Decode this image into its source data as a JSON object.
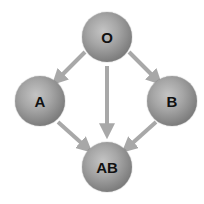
{
  "diagram": {
    "nodes": [
      {
        "id": "O",
        "label": "O",
        "cx": 107,
        "cy": 37
      },
      {
        "id": "A",
        "label": "A",
        "cx": 40,
        "cy": 101
      },
      {
        "id": "B",
        "label": "B",
        "cx": 172,
        "cy": 101
      },
      {
        "id": "AB",
        "label": "AB",
        "cx": 107,
        "cy": 167
      }
    ],
    "edges": [
      {
        "from": "O",
        "to": "A"
      },
      {
        "from": "O",
        "to": "AB"
      },
      {
        "from": "O",
        "to": "B"
      },
      {
        "from": "A",
        "to": "AB"
      },
      {
        "from": "B",
        "to": "AB"
      }
    ],
    "colors": {
      "arrow": "#a8a8a8",
      "node_light": "#c4c4c4",
      "node_dark": "#5a5a5a",
      "label": "#111111"
    }
  }
}
